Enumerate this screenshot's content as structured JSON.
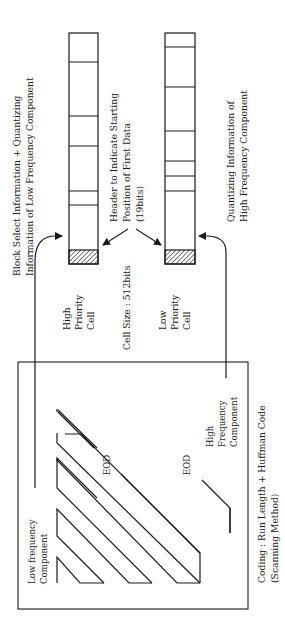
{
  "diagram": {
    "orientation": "rotated-90-ccw",
    "top_labels": {
      "high_priority_info": {
        "line1": "Block Select Information + Quantizing",
        "line2": "Information of Low Frequency Component"
      },
      "header_note": {
        "line1": "Header to Indicate Starting",
        "line2": "Position of First Data",
        "line3": "(19bits)"
      },
      "low_priority_info": {
        "line1": "Quantizing Information of",
        "line2": "High Frequency Component"
      }
    },
    "cells": {
      "high_priority": {
        "label_line1": "High",
        "label_line2": "Priority",
        "label_line3": "Cell"
      },
      "low_priority": {
        "label_line1": "Low",
        "label_line2": "Priority",
        "label_line3": "Cell"
      },
      "cell_size": "Cell Size :  512bits"
    },
    "scan_block": {
      "low_freq_line1": "Low frequency",
      "low_freq_line2": "Component",
      "high_freq_line1": "High",
      "high_freq_line2": "Frequency",
      "high_freq_line3": "Component",
      "eod_1": "EOD",
      "eod_2": "EOD"
    },
    "coding": {
      "line1": "Coding : Run Length + Huffman Code",
      "line2": "(Scanning Method)"
    }
  }
}
